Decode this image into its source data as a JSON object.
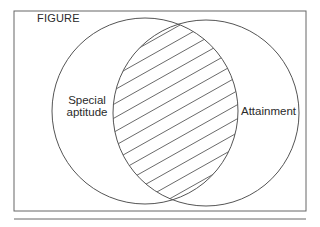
{
  "figure": {
    "title": "FIGURE",
    "sets": [
      {
        "id": "left",
        "label_line1": "Special",
        "label_line2": "aptitude",
        "label": "Special aptitude"
      },
      {
        "id": "right",
        "label": "Attainment"
      }
    ],
    "overlap": {
      "fill": "diagonal-hatch",
      "description": "intersection of Special aptitude and Attainment"
    },
    "colors": {
      "stroke": "#555555",
      "hatch": "#444444",
      "background": "#ffffff"
    }
  }
}
